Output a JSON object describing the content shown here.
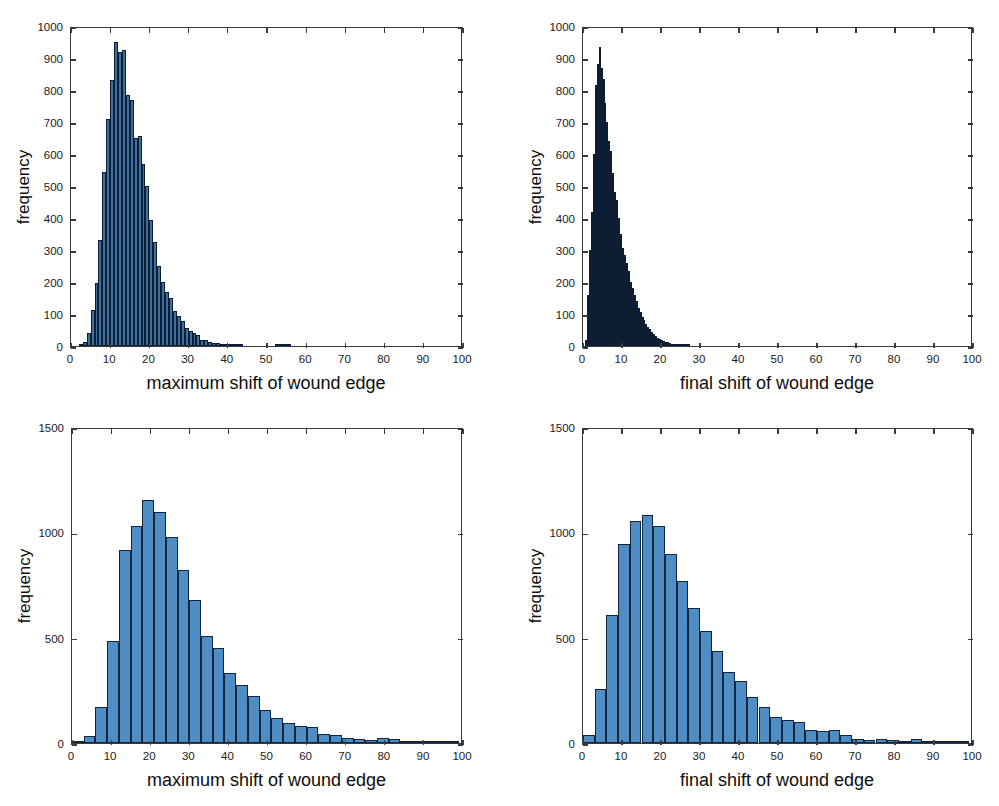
{
  "figure": {
    "background": "#ffffff",
    "bar_fill": "#4f8ec4",
    "bar_edge": "#12253f",
    "axis_color": "#3a3a3a",
    "panel_count": 4
  },
  "chart_data": [
    {
      "id": "top-left",
      "type": "bar",
      "title": "",
      "xlabel": "maximum shift of wound edge",
      "ylabel": "frequency",
      "xlim": [
        0,
        100
      ],
      "ylim": [
        0,
        1000
      ],
      "xticks": [
        0,
        10,
        20,
        30,
        40,
        50,
        60,
        70,
        80,
        90,
        100
      ],
      "yticks": [
        0,
        100,
        200,
        300,
        400,
        500,
        600,
        700,
        800,
        900,
        1000
      ],
      "grid": false,
      "legend": "none",
      "bin_width": 1,
      "bin_starts": [
        0,
        1,
        2,
        3,
        4,
        5,
        6,
        7,
        8,
        9,
        10,
        11,
        12,
        13,
        14,
        15,
        16,
        17,
        18,
        19,
        20,
        21,
        22,
        23,
        24,
        25,
        26,
        27,
        28,
        29,
        30,
        31,
        32,
        33,
        34,
        35,
        36,
        37,
        38,
        39,
        40,
        41,
        42,
        43,
        44,
        45,
        46,
        47,
        48,
        49,
        50,
        51,
        52,
        53,
        54,
        55,
        56,
        57,
        58,
        59,
        60,
        61,
        62,
        63,
        64,
        65,
        66,
        67,
        68,
        69,
        70
      ],
      "values": [
        0,
        0,
        2,
        14,
        40,
        112,
        196,
        330,
        544,
        710,
        830,
        950,
        920,
        925,
        785,
        770,
        650,
        655,
        570,
        500,
        395,
        325,
        250,
        200,
        170,
        150,
        110,
        95,
        78,
        55,
        48,
        40,
        35,
        20,
        18,
        14,
        10,
        8,
        5,
        4,
        4,
        2,
        2,
        1,
        0,
        0,
        0,
        0,
        0,
        0,
        0,
        0,
        1,
        1,
        2,
        1,
        0,
        0,
        0,
        0,
        0,
        0,
        0,
        0,
        0,
        0,
        0,
        0,
        0,
        0,
        0
      ]
    },
    {
      "id": "top-right",
      "type": "bar",
      "title": "",
      "xlabel": "final shift of wound edge",
      "ylabel": "frequency",
      "xlim": [
        0,
        100
      ],
      "ylim": [
        0,
        1000
      ],
      "xticks": [
        0,
        10,
        20,
        30,
        40,
        50,
        60,
        70,
        80,
        90,
        100
      ],
      "yticks": [
        0,
        100,
        200,
        300,
        400,
        500,
        600,
        700,
        800,
        900,
        1000
      ],
      "grid": false,
      "legend": "none",
      "bin_width": 0.5,
      "bin_starts": [
        0,
        0.5,
        1,
        1.5,
        2,
        2.5,
        3,
        3.5,
        4,
        4.5,
        5,
        5.5,
        6,
        6.5,
        7,
        7.5,
        8,
        8.5,
        9,
        9.5,
        10,
        10.5,
        11,
        11.5,
        12,
        12.5,
        13,
        13.5,
        14,
        14.5,
        15,
        15.5,
        16,
        16.5,
        17,
        17.5,
        18,
        18.5,
        19,
        19.5,
        20,
        20.5,
        21,
        21.5,
        22,
        22.5,
        23,
        23.5,
        24,
        24.5,
        25,
        25.5,
        26,
        26.5,
        27
      ],
      "values": [
        0,
        20,
        160,
        300,
        420,
        600,
        815,
        880,
        935,
        870,
        835,
        760,
        700,
        640,
        610,
        540,
        480,
        455,
        400,
        350,
        305,
        285,
        260,
        235,
        200,
        180,
        160,
        140,
        120,
        105,
        90,
        80,
        70,
        60,
        52,
        45,
        38,
        32,
        26,
        22,
        18,
        15,
        13,
        11,
        9,
        7,
        6,
        5,
        4,
        3,
        3,
        2,
        2,
        2,
        1
      ]
    },
    {
      "id": "bottom-left",
      "type": "bar",
      "title": "",
      "xlabel": "maximum shift of wound edge",
      "ylabel": "frequency",
      "xlim": [
        0,
        100
      ],
      "ylim": [
        0,
        1500
      ],
      "xticks": [
        0,
        10,
        20,
        30,
        40,
        50,
        60,
        70,
        80,
        90,
        100
      ],
      "yticks": [
        0,
        500,
        1000,
        1500
      ],
      "grid": false,
      "legend": "none",
      "bin_width": 3,
      "bin_starts": [
        0,
        3,
        6,
        9,
        12,
        15,
        18,
        21,
        24,
        27,
        30,
        33,
        36,
        39,
        42,
        45,
        48,
        51,
        54,
        57,
        60,
        63,
        66,
        69,
        72,
        75,
        78,
        81,
        84,
        87,
        90,
        93,
        96
      ],
      "values": [
        5,
        35,
        170,
        485,
        915,
        1030,
        1155,
        1095,
        980,
        820,
        680,
        510,
        450,
        330,
        275,
        225,
        155,
        120,
        95,
        80,
        75,
        45,
        38,
        25,
        18,
        15,
        22,
        20,
        10,
        6,
        5,
        4,
        3
      ]
    },
    {
      "id": "bottom-right",
      "type": "bar",
      "title": "",
      "xlabel": "final shift of wound edge",
      "ylabel": "frequency",
      "xlim": [
        0,
        100
      ],
      "ylim": [
        0,
        1500
      ],
      "xticks": [
        0,
        10,
        20,
        30,
        40,
        50,
        60,
        70,
        80,
        90,
        100
      ],
      "yticks": [
        0,
        500,
        1000,
        1500
      ],
      "grid": false,
      "legend": "none",
      "bin_width": 3,
      "bin_starts": [
        0,
        3,
        6,
        9,
        12,
        15,
        18,
        21,
        24,
        27,
        30,
        33,
        36,
        39,
        42,
        45,
        48,
        51,
        54,
        57,
        60,
        63,
        66,
        69,
        72,
        75,
        78,
        81,
        84,
        87,
        90,
        93,
        96
      ],
      "values": [
        40,
        255,
        610,
        945,
        1055,
        1080,
        1030,
        895,
        770,
        640,
        530,
        435,
        335,
        295,
        220,
        170,
        125,
        110,
        100,
        60,
        55,
        60,
        40,
        18,
        14,
        20,
        12,
        10,
        18,
        5,
        4,
        3,
        2
      ]
    }
  ]
}
